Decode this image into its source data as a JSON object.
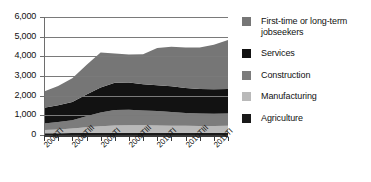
{
  "chart_data": {
    "type": "area",
    "stacked": true,
    "title": "",
    "xlabel": "",
    "ylabel": "",
    "ylim": [
      0,
      6000
    ],
    "ytick_labels": [
      "0",
      "1,000",
      "2,000",
      "3,000",
      "4,000",
      "5,000",
      "6,000"
    ],
    "ytick_values": [
      0,
      1000,
      2000,
      3000,
      4000,
      5000,
      6000
    ],
    "grid": true,
    "legend_position": "right",
    "x": [
      "2008TI",
      "2008TII",
      "2008TIII",
      "2008TIV",
      "2009TI",
      "2009TII",
      "2009TIII",
      "2009TIV",
      "2010TI",
      "2010TII",
      "2010TIII",
      "2010TIV",
      "2011TI",
      "2011TII"
    ],
    "xtick_labels": [
      "2008TI",
      "2008TIII",
      "2009TI",
      "2009TIII",
      "2010TI",
      "2010TIII",
      "2011TI"
    ],
    "xtick_label_indices": [
      0,
      2,
      4,
      6,
      8,
      10,
      12
    ],
    "series": [
      {
        "name": "Agriculture",
        "color": "#1a1a1a",
        "values": [
          90,
          95,
          100,
          105,
          110,
          115,
          115,
          115,
          115,
          115,
          115,
          115,
          115,
          115
        ]
      },
      {
        "name": "Manufacturing",
        "color": "#b9b9b9",
        "values": [
          160,
          190,
          230,
          290,
          340,
          370,
          380,
          375,
          370,
          360,
          350,
          345,
          345,
          350
        ]
      },
      {
        "name": "Construction",
        "color": "#7c7c7c",
        "values": [
          330,
          370,
          420,
          560,
          690,
          780,
          790,
          760,
          730,
          700,
          660,
          630,
          620,
          630
        ]
      },
      {
        "name": "Services",
        "color": "#121212",
        "values": [
          810,
          860,
          930,
          1100,
          1270,
          1390,
          1390,
          1330,
          1310,
          1300,
          1270,
          1250,
          1240,
          1250
        ]
      },
      {
        "name": "First-time or long-term jobseekers",
        "color": "#767676",
        "values": [
          820,
          980,
          1200,
          1500,
          1780,
          1490,
          1420,
          1530,
          1900,
          2010,
          2060,
          2110,
          2270,
          2490
        ]
      }
    ]
  },
  "legend": {
    "items": [
      {
        "label": "First-time or long-term jobseekers",
        "color": "#767676"
      },
      {
        "label": "Services",
        "color": "#121212"
      },
      {
        "label": "Construction",
        "color": "#7c7c7c"
      },
      {
        "label": "Manufacturing",
        "color": "#b9b9b9"
      },
      {
        "label": "Agriculture",
        "color": "#1a1a1a"
      }
    ]
  }
}
